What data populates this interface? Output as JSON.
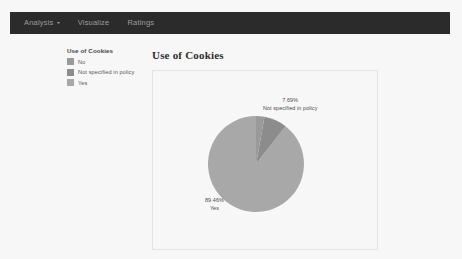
{
  "navbar": {
    "items": [
      {
        "label": "Analysis",
        "has_caret": true,
        "caret": "▾"
      },
      {
        "label": "Visualize",
        "has_caret": false
      },
      {
        "label": "Ratings",
        "has_caret": false
      }
    ],
    "background_color": "#2b2b2b",
    "text_color": "#9d9d9d"
  },
  "legend": {
    "title": "Use of Cookies",
    "items": [
      {
        "label": "No",
        "color": "#9a9a9a"
      },
      {
        "label": "Not specified in policy",
        "color": "#8c8c8c"
      },
      {
        "label": "Yes",
        "color": "#a8a8a8"
      }
    ]
  },
  "chart_panel": {
    "title": "Use of Cookies",
    "border_color": "#e3e3e3"
  },
  "chart_data": {
    "type": "pie",
    "title": "Use of Cookies",
    "legend_title": "Use of Cookies",
    "legend_position": "left",
    "categories": [
      "No",
      "Not specified in policy",
      "Yes"
    ],
    "values": [
      2.85,
      7.69,
      89.46
    ],
    "labels": [
      "",
      "7.69%",
      "89.46%"
    ],
    "colors": [
      "#9a9a9a",
      "#8c8c8c",
      "#a8a8a8"
    ],
    "annotations": [
      {
        "pct": "7.69%",
        "name": "Not specified in policy",
        "position": "top-right"
      },
      {
        "pct": "89.46%",
        "name": "Yes",
        "position": "bottom-left"
      }
    ],
    "xlabel": "",
    "ylabel": ""
  }
}
